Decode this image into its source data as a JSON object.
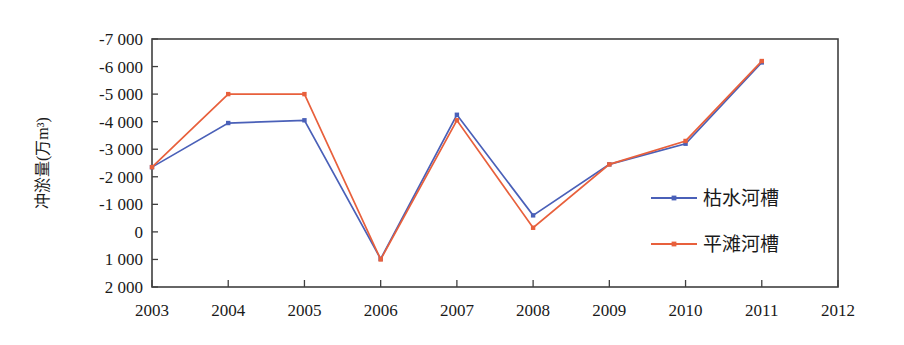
{
  "chart_data": {
    "type": "line",
    "title": "",
    "xlabel": "",
    "ylabel": "冲淤量(万m³)",
    "categories": [
      2003,
      2004,
      2005,
      2006,
      2007,
      2008,
      2009,
      2010,
      2011
    ],
    "x_tick_labels": [
      "2003",
      "2004",
      "2005",
      "2006",
      "2007",
      "2008",
      "2009",
      "2010",
      "2011",
      "2012"
    ],
    "x_tick_values": [
      2003,
      2004,
      2005,
      2006,
      2007,
      2008,
      2009,
      2010,
      2011,
      2012
    ],
    "xlim": [
      2003,
      2012
    ],
    "y_tick_labels": [
      "-7 000",
      "-6 000",
      "-5 000",
      "-4 000",
      "-3 000",
      "-2 000",
      "-1 000",
      "0",
      "1 000",
      "2 000"
    ],
    "y_tick_values": [
      -7000,
      -6000,
      -5000,
      -4000,
      -3000,
      -2000,
      -1000,
      0,
      1000,
      2000
    ],
    "ylim": [
      -7000,
      2000
    ],
    "y_axis_inverted": true,
    "grid": false,
    "legend_position": "inside-right",
    "series": [
      {
        "name": "枯水河槽",
        "color": "#4A60B8",
        "marker": "square",
        "values": [
          -2350,
          -3950,
          -4050,
          980,
          -4250,
          -600,
          -2450,
          -3200,
          -6150
        ]
      },
      {
        "name": "平滩河槽",
        "color": "#E8603C",
        "marker": "square",
        "values": [
          -2350,
          -5000,
          -5000,
          1000,
          -4050,
          -150,
          -2450,
          -3300,
          -6200
        ]
      }
    ]
  }
}
